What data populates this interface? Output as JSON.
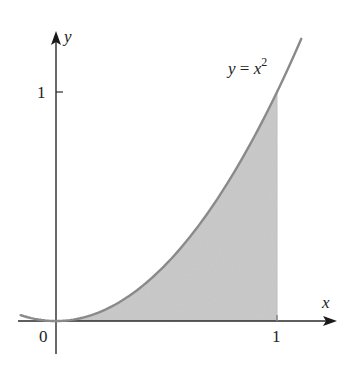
{
  "figure": {
    "curve_label": {
      "lhs": "y",
      "eq": " = ",
      "base": "x",
      "exp": "2"
    },
    "axes": {
      "x_label": "x",
      "y_label": "y",
      "x_tick_label": "1",
      "y_tick_label": "1",
      "origin_label": "0"
    },
    "colors": {
      "curve": "#8a8a8a",
      "shade": "#c8c8c8",
      "axis": "#2a2a2a"
    }
  },
  "chart_data": {
    "type": "area",
    "title": "",
    "function": "y = x^2",
    "shaded_region": {
      "from_x": 0,
      "to_x": 1,
      "under": "y = x^2",
      "above": "x-axis"
    },
    "x": [
      -0.16,
      0,
      0.25,
      0.5,
      0.75,
      1,
      1.11
    ],
    "y": [
      0.026,
      0,
      0.0625,
      0.25,
      0.5625,
      1,
      1.23
    ],
    "xlabel": "x",
    "ylabel": "y",
    "x_ticks": [
      {
        "value": 1,
        "label": "1"
      }
    ],
    "y_ticks": [
      {
        "value": 1,
        "label": "1"
      }
    ],
    "origin_label": "0",
    "annotations": [
      "y = x^2"
    ],
    "grid": false
  }
}
